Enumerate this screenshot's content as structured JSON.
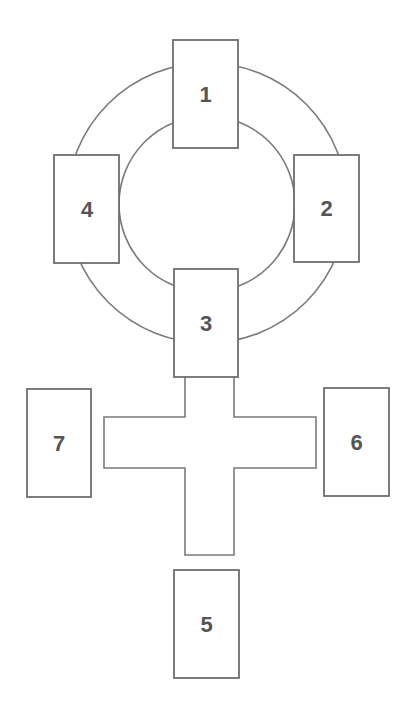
{
  "diagram": {
    "type": "card-spread-layout",
    "colors": {
      "stroke": "#7a7a7a",
      "card_fill": "#ffffff",
      "label": "#555555",
      "background": "#ffffff"
    },
    "ring": {
      "center": [
        207,
        203
      ],
      "outer_radius": 140,
      "inner_radius": 88
    },
    "cross": {
      "stem": {
        "x1": 185,
        "x2": 234,
        "y_top": 377,
        "y_bottom": 555
      },
      "arms": {
        "x_left": 104,
        "x_right": 316,
        "y_top": 417,
        "y_bottom": 468
      }
    },
    "cards": [
      {
        "label": "1",
        "x": 173,
        "y": 40,
        "w": 65,
        "h": 108
      },
      {
        "label": "2",
        "x": 294,
        "y": 155,
        "w": 65,
        "h": 107
      },
      {
        "label": "3",
        "x": 174,
        "y": 269,
        "w": 64,
        "h": 108
      },
      {
        "label": "4",
        "x": 54,
        "y": 155,
        "w": 65,
        "h": 108
      },
      {
        "label": "5",
        "x": 174,
        "y": 570,
        "w": 65,
        "h": 108
      },
      {
        "label": "6",
        "x": 324,
        "y": 388,
        "w": 65,
        "h": 108
      },
      {
        "label": "7",
        "x": 27,
        "y": 389,
        "w": 64,
        "h": 108
      }
    ]
  }
}
